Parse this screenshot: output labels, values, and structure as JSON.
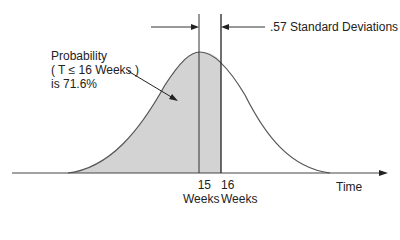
{
  "annotation": {
    "line1": "Probability",
    "line2": "( T ≤ 16 Weeks )",
    "line3": "is 71.6%"
  },
  "deviation_label": ".57 Standard Deviations",
  "ticks": [
    {
      "value": "15",
      "unit": "Weeks"
    },
    {
      "value": "16",
      "unit": "Weeks"
    }
  ],
  "axis_label": "Time",
  "colors": {
    "fill": "#d3d3d3",
    "curve": "#555555",
    "axis": "#333333"
  }
}
